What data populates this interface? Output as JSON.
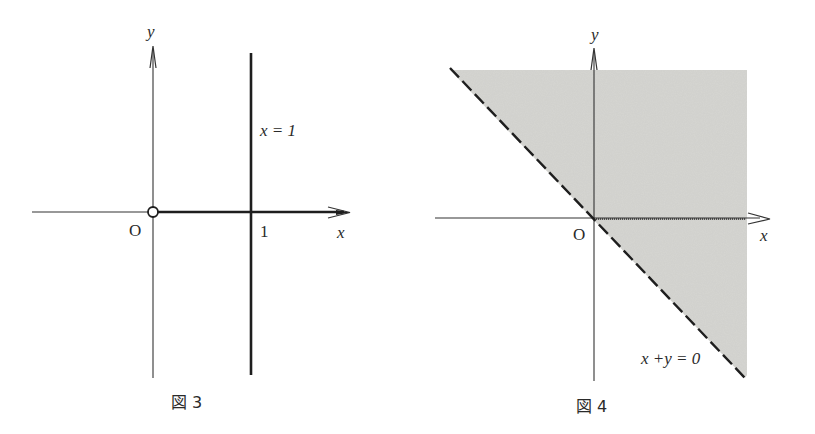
{
  "figures": [
    {
      "id": "fig3",
      "caption": "図 3",
      "axis_labels": {
        "x": "x",
        "y": "y"
      },
      "origin_label": "O",
      "tick_label": "1",
      "line_label": "x = 1",
      "elements": {
        "vertical_line": "x = 1 (solid, bold)",
        "ray": "positive x-axis from origin (bold), origin excluded (open circle)"
      }
    },
    {
      "id": "fig4",
      "caption": "図 4",
      "axis_labels": {
        "x": "x",
        "y": "y"
      },
      "origin_label": "O",
      "line_label": "x +y = 0",
      "elements": {
        "boundary": "x + y = 0 (dashed)",
        "shaded_region": "x + y > 0"
      }
    }
  ],
  "colors": {
    "ink": "#2a2a2a",
    "shade": "#d6d6d2",
    "background": "#ffffff"
  }
}
